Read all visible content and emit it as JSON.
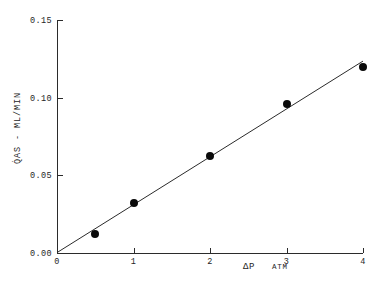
{
  "chart_data": {
    "type": "scatter",
    "title": "",
    "xlabel": "ΔP",
    "xunit": "ATM",
    "ylabel": "Q̇AS - ML/MIN",
    "xlim": [
      0,
      4
    ],
    "ylim": [
      0,
      0.15
    ],
    "grid": false,
    "legend": null,
    "x_ticks": [
      "0",
      "1",
      "2",
      "3",
      "4"
    ],
    "x_tick_values": [
      0,
      1,
      2,
      3,
      4
    ],
    "y_ticks": [
      "0.00",
      "0.05",
      "0.10",
      "0.15"
    ],
    "y_tick_values": [
      0.0,
      0.05,
      0.1,
      0.15
    ],
    "series": [
      {
        "name": "measured gas flow",
        "marker": "filled-circle",
        "color": "#0a0a0a",
        "x": [
          0.5,
          1.0,
          2.0,
          3.0,
          4.0
        ],
        "values": [
          0.012,
          0.032,
          0.062,
          0.096,
          0.12
        ]
      },
      {
        "name": "linear fit through origin",
        "type": "line",
        "color": "#2b2b2b",
        "x": [
          0,
          4
        ],
        "values": [
          0,
          0.1235
        ]
      }
    ]
  },
  "figure": {
    "caption": ""
  }
}
